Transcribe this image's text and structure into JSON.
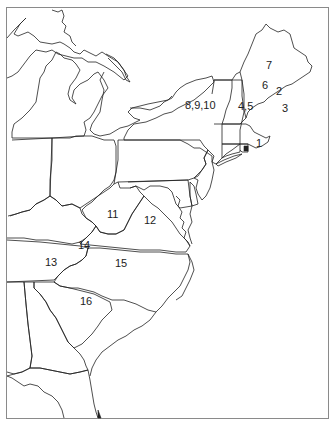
{
  "map": {
    "title": "Eastern United States",
    "labels": [
      {
        "id": "7",
        "text": "7",
        "x": 266,
        "y": 69
      },
      {
        "id": "6",
        "text": "6",
        "x": 262,
        "y": 89
      },
      {
        "id": "2",
        "text": "2",
        "x": 276,
        "y": 95
      },
      {
        "id": "3",
        "text": "3",
        "x": 282,
        "y": 112
      },
      {
        "id": "4-5",
        "text": "4,5",
        "x": 238,
        "y": 110
      },
      {
        "id": "8-9-10",
        "text": "8,9,10",
        "x": 185,
        "y": 109
      },
      {
        "id": "1",
        "text": "1",
        "x": 256,
        "y": 147
      },
      {
        "id": "11",
        "text": "11",
        "x": 107,
        "y": 218
      },
      {
        "id": "12",
        "text": "12",
        "x": 144,
        "y": 224
      },
      {
        "id": "14",
        "text": "14",
        "x": 78,
        "y": 249
      },
      {
        "id": "13",
        "text": "13",
        "x": 45,
        "y": 266
      },
      {
        "id": "15",
        "text": "15",
        "x": 115,
        "y": 267
      },
      {
        "id": "16",
        "text": "16",
        "x": 80,
        "y": 305
      }
    ],
    "colors": {
      "background": "#ffffff",
      "outline": "#222222",
      "frame": "#8a8a8a"
    }
  }
}
